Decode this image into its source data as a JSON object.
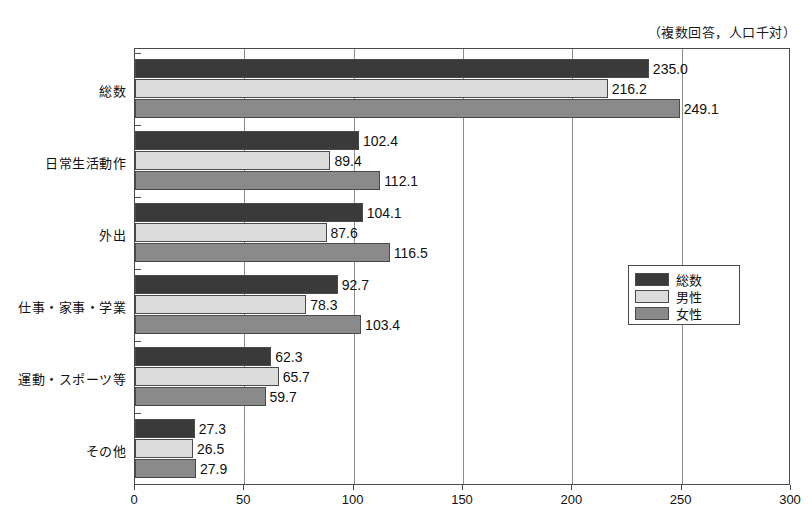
{
  "chart_data": {
    "type": "bar",
    "orientation": "horizontal",
    "title": "",
    "unit_note": "（複数回答，人口千対）",
    "xlabel": "",
    "ylabel": "",
    "xlim": [
      0,
      300
    ],
    "xticks": [
      0,
      50,
      100,
      150,
      200,
      250,
      300
    ],
    "grid": true,
    "legend_position": "center-right",
    "categories": [
      "総数",
      "日常生活動作",
      "外出",
      "仕事・家事・学業",
      "運動・スポーツ等",
      "その他"
    ],
    "series": [
      {
        "name": "総数",
        "color": "#3a3a3a",
        "values": [
          235.0,
          102.4,
          104.1,
          92.7,
          62.3,
          27.3
        ],
        "labels": [
          "235.0",
          "102.4",
          "104.1",
          "92.7",
          "62.3",
          "27.3"
        ]
      },
      {
        "name": "男性",
        "color": "#dcdcdc",
        "values": [
          216.2,
          89.4,
          87.6,
          78.3,
          65.7,
          26.5
        ],
        "labels": [
          "216.2",
          "89.4",
          "87.6",
          "78.3",
          "65.7",
          "26.5"
        ]
      },
      {
        "name": "女性",
        "color": "#8a8a8a",
        "values": [
          249.1,
          112.1,
          116.5,
          103.4,
          59.7,
          27.9
        ],
        "labels": [
          "249.1",
          "112.1",
          "116.5",
          "103.4",
          "59.7",
          "27.9"
        ]
      }
    ]
  },
  "axis": {
    "tick_labels": [
      "0",
      "50",
      "100",
      "150",
      "200",
      "250",
      "300"
    ]
  },
  "legend": {
    "items": [
      {
        "label": "総数",
        "color": "#3a3a3a"
      },
      {
        "label": "男性",
        "color": "#dcdcdc"
      },
      {
        "label": "女性",
        "color": "#8a8a8a"
      }
    ]
  }
}
